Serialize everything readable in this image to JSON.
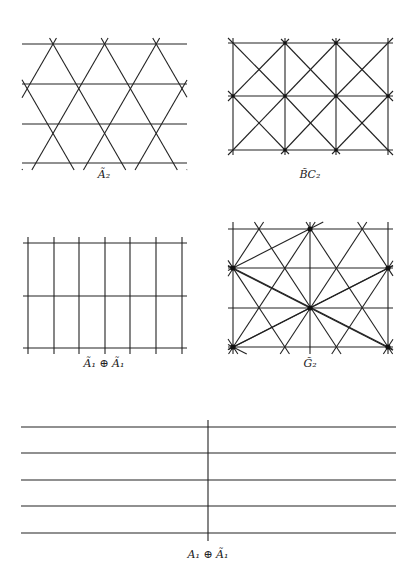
{
  "figure": {
    "panels": [
      {
        "id": "A2",
        "label": "Ã₂",
        "label_x": 104,
        "label_y": 170
      },
      {
        "id": "BC2",
        "label": "B̃C₂",
        "label_x": 310,
        "label_y": 171
      },
      {
        "id": "A1A1",
        "label": "Ã₁ ⊕ Ã₁",
        "label_x": 104,
        "label_y": 358
      },
      {
        "id": "G2",
        "label": "G̃₂",
        "label_x": 310,
        "label_y": 358
      },
      {
        "id": "A1A1b",
        "label": "A₁ ⊕ Ã₁",
        "label_x": 208,
        "label_y": 549
      }
    ],
    "line_color": "#222222",
    "node_color": "#111111"
  }
}
